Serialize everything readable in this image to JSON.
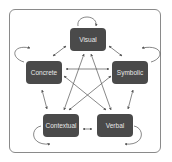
{
  "diagram": {
    "nodes": [
      {
        "id": "visual",
        "label": "Visual"
      },
      {
        "id": "concrete",
        "label": "Concrete"
      },
      {
        "id": "symbolic",
        "label": "Symbolic"
      },
      {
        "id": "contextual",
        "label": "Contextual"
      },
      {
        "id": "verbal",
        "label": "Verbal"
      }
    ],
    "edges": [
      {
        "from": "visual",
        "to": "concrete",
        "type": "bidirectional"
      },
      {
        "from": "visual",
        "to": "symbolic",
        "type": "bidirectional"
      },
      {
        "from": "concrete",
        "to": "symbolic",
        "type": "bidirectional"
      },
      {
        "from": "concrete",
        "to": "contextual",
        "type": "bidirectional"
      },
      {
        "from": "symbolic",
        "to": "verbal",
        "type": "bidirectional"
      },
      {
        "from": "contextual",
        "to": "verbal",
        "type": "bidirectional"
      },
      {
        "from": "visual",
        "to": "contextual",
        "type": "bidirectional"
      },
      {
        "from": "visual",
        "to": "verbal",
        "type": "bidirectional"
      },
      {
        "from": "concrete",
        "to": "verbal",
        "type": "bidirectional"
      },
      {
        "from": "symbolic",
        "to": "contextual",
        "type": "bidirectional"
      },
      {
        "from": "visual",
        "to": "visual",
        "type": "self-loop"
      },
      {
        "from": "concrete",
        "to": "concrete",
        "type": "self-loop"
      },
      {
        "from": "symbolic",
        "to": "symbolic",
        "type": "self-loop"
      },
      {
        "from": "contextual",
        "to": "contextual",
        "type": "self-loop"
      },
      {
        "from": "verbal",
        "to": "verbal",
        "type": "self-loop"
      }
    ],
    "colors": {
      "node_fill": "#4a4a4a",
      "node_text": "#e8e8e8",
      "arrow": "#555555",
      "frame": "#8a8a8a"
    }
  }
}
